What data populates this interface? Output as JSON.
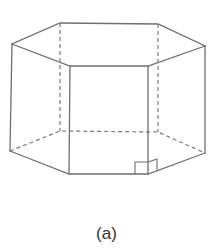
{
  "figure": {
    "caption": "(a)",
    "colors": {
      "edge": "#6f6f6f",
      "hidden_edge": "#7a7a7a",
      "background": "#ffffff"
    },
    "top_face": [
      [
        60,
        23
      ],
      [
        158,
        24
      ],
      [
        205,
        46
      ],
      [
        148,
        66
      ],
      [
        70,
        66
      ],
      [
        12,
        44
      ]
    ],
    "bottom_face": [
      [
        60,
        131
      ],
      [
        158,
        132
      ],
      [
        205,
        153
      ],
      [
        148,
        174
      ],
      [
        69,
        174
      ],
      [
        10,
        151
      ]
    ],
    "annotations": [
      "right-angle-marker"
    ]
  }
}
